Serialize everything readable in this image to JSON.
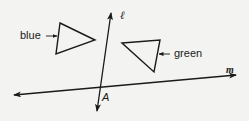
{
  "diagram": {
    "type": "geometry",
    "colors": {
      "ink": "#1a1a1a",
      "background": "#f3f3f1"
    },
    "lines": [
      {
        "id": "l",
        "label": "ℓ",
        "from": [
          97,
          111
        ],
        "to": [
          111,
          13
        ],
        "arrows": "both"
      },
      {
        "id": "m",
        "label": "m",
        "from": [
          14,
          95
        ],
        "to": [
          236,
          75
        ],
        "arrows": "both"
      }
    ],
    "intersection": {
      "label": "A",
      "point": [
        101,
        88
      ]
    },
    "triangles": [
      {
        "name": "blue",
        "label": "blue",
        "vertices": [
          [
            60,
            23
          ],
          [
            95,
            40
          ],
          [
            56,
            54
          ]
        ]
      },
      {
        "name": "green",
        "label": "green",
        "vertices": [
          [
            122,
            43
          ],
          [
            160,
            40
          ],
          [
            154,
            72
          ]
        ]
      }
    ],
    "labels": {
      "blue": "blue",
      "green": "green",
      "point_a": "A",
      "line_m": "m",
      "line_l": "ℓ"
    }
  }
}
